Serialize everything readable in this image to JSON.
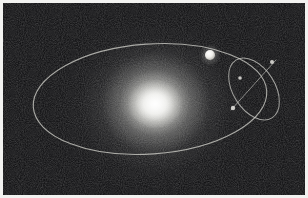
{
  "figure": {
    "kind": "orbital-diagram",
    "frame_color": "#f2f2f0",
    "background_color": "#0a0a0c",
    "star_color": "#ffffff",
    "orbit_stroke_color": "#cfcfc9",
    "planet_color": "#f2f1ec",
    "node_color": "#e6e5e0"
  },
  "star": {
    "name": "central-star",
    "cx": 152,
    "cy": 100,
    "glow_radius": 98
  },
  "primary_orbit": {
    "name": "planet-orbit",
    "cx": 150,
    "cy": 99,
    "rx": 117,
    "ry": 55,
    "rotation_deg": -4,
    "stroke_width": 1.1,
    "opacity": 0.78
  },
  "planet": {
    "name": "planet",
    "cx": 207,
    "cy": 52,
    "radius": 5
  },
  "secondary_orbit": {
    "name": "satellite-orbit",
    "cx": 254,
    "cy": 89,
    "rx": 21,
    "ry": 34,
    "rotation_deg": -32,
    "stroke_width": 1.0,
    "opacity": 0.72
  },
  "node_line": {
    "name": "line-of-nodes",
    "x1": 231,
    "y1": 110,
    "x2": 276,
    "y2": 60,
    "stroke_width": 0.9,
    "opacity": 0.66
  },
  "nodes": [
    {
      "name": "node-ascending",
      "cx": 233,
      "cy": 108,
      "r": 2.2
    },
    {
      "name": "node-descending",
      "cx": 272,
      "cy": 62,
      "r": 2.0
    },
    {
      "name": "node-crossing",
      "cx": 240,
      "cy": 78,
      "r": 1.8
    }
  ]
}
